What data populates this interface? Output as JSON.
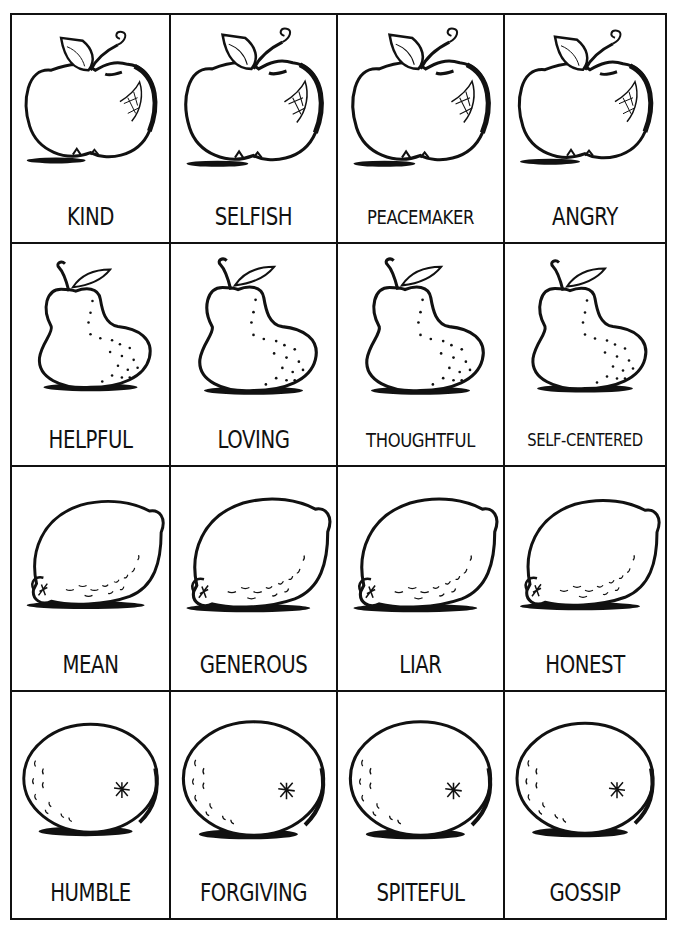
{
  "worksheet": {
    "rows": [
      {
        "fruit": "apple",
        "cards": [
          {
            "label": "KIND"
          },
          {
            "label": "SELFISH"
          },
          {
            "label": "PEACEMAKER"
          },
          {
            "label": "ANGRY"
          }
        ]
      },
      {
        "fruit": "pear",
        "cards": [
          {
            "label": "HELPFUL"
          },
          {
            "label": "LOVING"
          },
          {
            "label": "THOUGHTFUL"
          },
          {
            "label": "SELF-CENTERED"
          }
        ]
      },
      {
        "fruit": "lemon",
        "cards": [
          {
            "label": "MEAN"
          },
          {
            "label": "GENEROUS"
          },
          {
            "label": "LIAR"
          },
          {
            "label": "HONEST"
          }
        ]
      },
      {
        "fruit": "orange",
        "cards": [
          {
            "label": "HUMBLE"
          },
          {
            "label": "FORGIVING"
          },
          {
            "label": "SPITEFUL"
          },
          {
            "label": "GOSSIP"
          }
        ]
      }
    ]
  },
  "colors": {
    "ink": "#111111",
    "paper": "#ffffff"
  }
}
